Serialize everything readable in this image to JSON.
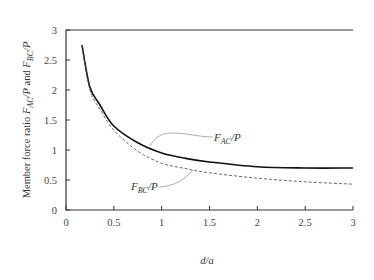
{
  "chart_data": {
    "type": "line",
    "title": "",
    "xlabel": "d/a",
    "ylabel": "Member force ratio F_AC/P and F_BC/P",
    "xlim": [
      0,
      3
    ],
    "ylim": [
      0,
      3
    ],
    "xticks": [
      "0",
      "0.5",
      "1",
      "1.5",
      "2",
      "2.5",
      "3"
    ],
    "yticks": [
      "0",
      "0.5",
      "1",
      "1.5",
      "2",
      "2.5",
      "3"
    ],
    "grid": false,
    "legend": "inline annotations with leader lines",
    "series": [
      {
        "name": "F_AC/P",
        "style": "solid",
        "x": [
          0.167,
          0.25,
          0.355,
          0.5,
          0.75,
          1.0,
          1.25,
          1.5,
          2.0,
          2.5,
          3.0
        ],
        "y": [
          2.75,
          2.05,
          1.75,
          1.4,
          1.12,
          0.95,
          0.86,
          0.8,
          0.72,
          0.7,
          0.7
        ]
      },
      {
        "name": "F_BC/P",
        "style": "dashed",
        "x": [
          0.167,
          0.25,
          0.355,
          0.5,
          0.75,
          1.0,
          1.25,
          1.5,
          2.0,
          2.5,
          3.0
        ],
        "y": [
          2.75,
          2.0,
          1.68,
          1.33,
          0.98,
          0.78,
          0.69,
          0.62,
          0.53,
          0.47,
          0.43
        ]
      }
    ],
    "annotations": [
      {
        "text": "F_AC/P",
        "main": "F",
        "sub": "AC",
        "suffix": "/P",
        "points_to": "solid curve near d/a≈0.9"
      },
      {
        "text": "F_BC/P",
        "main": "F",
        "sub": "BC",
        "suffix": "/P",
        "points_to": "dashed curve near d/a≈1.35"
      }
    ]
  },
  "axis": {
    "x_title_main": "d",
    "x_title_rest": "/a",
    "y_title_prefix": "Member force ratio ",
    "y_title_and": " and "
  },
  "labels": {
    "ac_main": "F",
    "ac_sub": "AC",
    "ac_suffix": "/P",
    "bc_main": "F",
    "bc_sub": "BC",
    "bc_suffix": "/P"
  },
  "colors": {
    "axis": "#333333",
    "solid_line": "#111111",
    "dashed_line": "#555555",
    "leader": "#888888"
  }
}
